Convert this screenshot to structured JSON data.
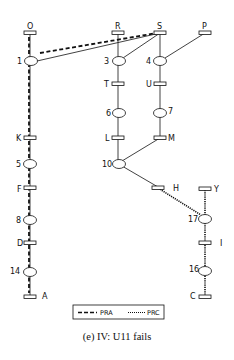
{
  "caption": "(e) IV: U11 fails",
  "legend": {
    "items": [
      {
        "label": "PRA",
        "style": "dashed"
      },
      {
        "label": "PRC",
        "style": "dotted"
      }
    ]
  },
  "colors": {
    "stroke": "#111111",
    "background": "#ffffff"
  },
  "nodes": {
    "transitions": [
      {
        "id": "O",
        "label": "O"
      },
      {
        "id": "R",
        "label": "R"
      },
      {
        "id": "S",
        "label": "S"
      },
      {
        "id": "P",
        "label": "P"
      },
      {
        "id": "T",
        "label": "T"
      },
      {
        "id": "U",
        "label": "U"
      },
      {
        "id": "K",
        "label": "K"
      },
      {
        "id": "L",
        "label": "L"
      },
      {
        "id": "M",
        "label": "M"
      },
      {
        "id": "F",
        "label": "F"
      },
      {
        "id": "H",
        "label": "H"
      },
      {
        "id": "Y",
        "label": "Y"
      },
      {
        "id": "D",
        "label": "D"
      },
      {
        "id": "I",
        "label": "I"
      },
      {
        "id": "A",
        "label": "A"
      },
      {
        "id": "C",
        "label": "C"
      }
    ],
    "places": [
      {
        "id": "1",
        "label": "1"
      },
      {
        "id": "3",
        "label": "3"
      },
      {
        "id": "4",
        "label": "4"
      },
      {
        "id": "6",
        "label": "6"
      },
      {
        "id": "7",
        "label": "7"
      },
      {
        "id": "5",
        "label": "5"
      },
      {
        "id": "10",
        "label": "10"
      },
      {
        "id": "8",
        "label": "8"
      },
      {
        "id": "17",
        "label": "17"
      },
      {
        "id": "14",
        "label": "14"
      },
      {
        "id": "16",
        "label": "16"
      }
    ]
  },
  "edges": [
    {
      "from": "O",
      "to": "1",
      "style": "solid"
    },
    {
      "from": "1",
      "to": "S",
      "style": "solid"
    },
    {
      "from": "R",
      "to": "3",
      "style": "solid"
    },
    {
      "from": "S",
      "to": "3",
      "style": "solid"
    },
    {
      "from": "S",
      "to": "4",
      "style": "solid"
    },
    {
      "from": "P",
      "to": "4",
      "style": "solid"
    },
    {
      "from": "3",
      "to": "T",
      "style": "solid"
    },
    {
      "from": "T",
      "to": "6",
      "style": "solid"
    },
    {
      "from": "6",
      "to": "L",
      "style": "solid"
    },
    {
      "from": "4",
      "to": "U",
      "style": "solid"
    },
    {
      "from": "U",
      "to": "7",
      "style": "solid"
    },
    {
      "from": "7",
      "to": "M",
      "style": "solid"
    },
    {
      "from": "L",
      "to": "10",
      "style": "solid"
    },
    {
      "from": "M",
      "to": "10",
      "style": "solid"
    },
    {
      "from": "10",
      "to": "H",
      "style": "solid"
    },
    {
      "from": "1",
      "to": "A",
      "style": "solid"
    },
    {
      "from": "H",
      "to": "17",
      "style": "PRC"
    },
    {
      "from": "Y",
      "to": "C",
      "style": "PRC"
    },
    {
      "from": "O",
      "to": "A",
      "style": "PRA"
    },
    {
      "from": "1",
      "to": "S",
      "style": "PRA"
    }
  ]
}
